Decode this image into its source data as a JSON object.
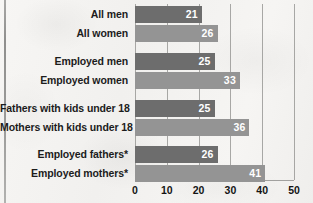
{
  "chart_data": {
    "type": "bar",
    "orientation": "horizontal",
    "title": "",
    "subtitle": "",
    "xlabel": "",
    "ylabel": "",
    "xlim": [
      0,
      50
    ],
    "xticks": [
      "0",
      "10",
      "20",
      "30",
      "40",
      "50"
    ],
    "grid": true,
    "legend": "none",
    "categories": [
      "All men",
      "All women",
      "Employed men",
      "Employed women",
      "Fathers with kids under 18",
      "Mothers with kids under 18",
      "Employed fathers*",
      "Employed mothers*"
    ],
    "values": [
      21,
      26,
      25,
      33,
      25,
      36,
      26,
      41
    ],
    "value_labels": [
      "21",
      "26",
      "25",
      "33",
      "25",
      "36",
      "26",
      "41"
    ],
    "bar_styles": [
      "dark",
      "light",
      "dark",
      "light",
      "dark",
      "light",
      "dark",
      "light"
    ],
    "groups": [
      {
        "rows": [
          0,
          1
        ]
      },
      {
        "rows": [
          2,
          3
        ]
      },
      {
        "rows": [
          4,
          5
        ]
      },
      {
        "rows": [
          6,
          7
        ]
      }
    ],
    "colors": {
      "bar_dark": "#6d6d6d",
      "bar_light": "#949494",
      "value_text": "#ffffff",
      "label_text": "#1c1c1c",
      "gridline": "#8d8d8b",
      "background": "#f4f3f1"
    }
  },
  "rows": [
    {
      "label": "All men",
      "value": "21",
      "style": "dark",
      "top": 6,
      "value_num": 21
    },
    {
      "label": "All women",
      "value": "26",
      "style": "light",
      "top": 25,
      "value_num": 26
    },
    {
      "label": "Employed men",
      "value": "25",
      "style": "dark",
      "top": 53,
      "value_num": 25
    },
    {
      "label": "Employed women",
      "value": "33",
      "style": "light",
      "top": 72,
      "value_num": 33
    },
    {
      "label": "Fathers with kids under 18",
      "value": "25",
      "style": "dark",
      "top": 100,
      "value_num": 25
    },
    {
      "label": "Mothers with kids under 18",
      "value": "36",
      "style": "light",
      "top": 119,
      "value_num": 36
    },
    {
      "label": "Employed fathers*",
      "value": "26",
      "style": "dark",
      "top": 146,
      "value_num": 26
    },
    {
      "label": "Employed mothers*",
      "value": "41",
      "style": "light",
      "top": 165,
      "value_num": 41
    }
  ],
  "xaxis": {
    "ticks": [
      {
        "label": "0",
        "value": 0
      },
      {
        "label": "10",
        "value": 10
      },
      {
        "label": "20",
        "value": 20
      },
      {
        "label": "30",
        "value": 30
      },
      {
        "label": "40",
        "value": 40
      },
      {
        "label": "50",
        "value": 50
      }
    ]
  }
}
